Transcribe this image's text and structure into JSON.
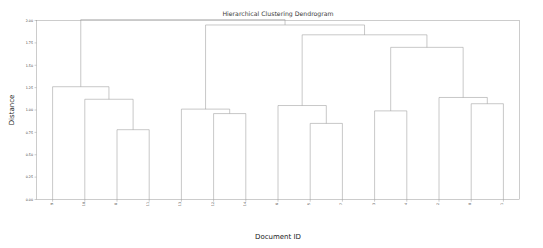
{
  "figure": {
    "title": "Hierarchical Clustering Dendrogram",
    "background_color": "#ffffff",
    "line_color": "#9b9b9b",
    "axis_color": "#9a9a9a"
  },
  "chart_data": {
    "type": "line",
    "chart_kind": "dendrogram",
    "title": "Hierarchical Clustering Dendrogram",
    "xlabel": "Document ID",
    "ylabel": "Distance",
    "ylim": [
      0.0,
      2.0
    ],
    "ytick_labels": [
      "0.00",
      "0.25",
      "0.50",
      "0.75",
      "1.00",
      "1.25",
      "1.50",
      "1.75",
      "2.00"
    ],
    "ytick_values": [
      0.0,
      0.25,
      0.5,
      0.75,
      1.0,
      1.25,
      1.5,
      1.75,
      2.0
    ],
    "grid": false,
    "legend": "none",
    "leaf_labels": [
      "9",
      "10",
      "8",
      "11",
      "13",
      "12",
      "14",
      "6",
      "5",
      "7",
      "3",
      "4",
      "2",
      "0",
      "1"
    ],
    "leaf_count": 15,
    "orientation": "top",
    "merges": [
      {
        "id": "m1",
        "label": "8 + 11",
        "left": "8",
        "right": "11",
        "height": 0.78
      },
      {
        "id": "m2",
        "label": "10 + (8,11)",
        "left": "10",
        "right": "m1",
        "height": 1.12
      },
      {
        "id": "m3",
        "label": "9 + (10,8,11)",
        "left": "9",
        "right": "m2",
        "height": 1.26
      },
      {
        "id": "m4",
        "label": "12 + 14",
        "left": "12",
        "right": "14",
        "height": 0.96
      },
      {
        "id": "m5",
        "label": "13 + (12,14)",
        "left": "13",
        "right": "m4",
        "height": 1.01
      },
      {
        "id": "m6",
        "label": "5 + 7",
        "left": "5",
        "right": "7",
        "height": 0.85
      },
      {
        "id": "m7",
        "label": "6 + (5,7)",
        "left": "6",
        "right": "m6",
        "height": 1.05
      },
      {
        "id": "m8",
        "label": "3 + 4",
        "left": "3",
        "right": "4",
        "height": 0.99
      },
      {
        "id": "m9",
        "label": "0 + 1",
        "left": "0",
        "right": "1",
        "height": 1.07
      },
      {
        "id": "m10",
        "label": "2 + (0,1)",
        "left": "2",
        "right": "m9",
        "height": 1.14
      },
      {
        "id": "m11",
        "label": "(3,4) + (2,0,1)",
        "left": "m8",
        "right": "m10",
        "height": 1.7
      },
      {
        "id": "m12",
        "label": "(6,5,7) + m11",
        "left": "m7",
        "right": "m11",
        "height": 1.84
      },
      {
        "id": "m13",
        "label": "(13,12,14) + m12",
        "left": "m5",
        "right": "m12",
        "height": 1.95
      },
      {
        "id": "m14",
        "label": "(9,10,8,11) + m13",
        "left": "m3",
        "right": "m13",
        "height": 2.01
      }
    ]
  }
}
